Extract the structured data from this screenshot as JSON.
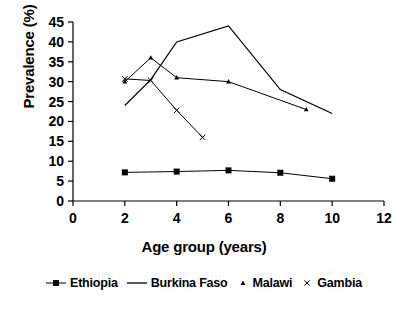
{
  "chart_data": {
    "type": "line",
    "title": "",
    "xlabel": "Age group (years)",
    "ylabel": "Prevalence (%)",
    "xlim": [
      0,
      12
    ],
    "ylim": [
      0,
      45
    ],
    "xticks": [
      0,
      2,
      4,
      6,
      8,
      10,
      12
    ],
    "yticks": [
      0,
      5,
      10,
      15,
      20,
      25,
      30,
      35,
      40,
      45
    ],
    "xtick_labels": [
      "0",
      "2",
      "4",
      "6",
      "8",
      "10",
      "12"
    ],
    "ytick_labels": [
      "0",
      "5",
      "10",
      "15",
      "20",
      "25",
      "30",
      "35",
      "40",
      "45"
    ],
    "grid": false,
    "legend_position": "bottom",
    "series": [
      {
        "name": "Ethiopia",
        "marker": "square",
        "color": "#000000",
        "x": [
          2,
          4,
          6,
          8,
          10
        ],
        "values": [
          7.2,
          7.4,
          7.7,
          7.1,
          5.6
        ]
      },
      {
        "name": "Burkina Faso",
        "marker": "none",
        "color": "#000000",
        "x": [
          2,
          3,
          4,
          6,
          8,
          10
        ],
        "values": [
          24,
          30.5,
          40,
          44,
          28,
          22
        ]
      },
      {
        "name": "Malawi",
        "marker": "triangle",
        "color": "#000000",
        "x": [
          2,
          3,
          4,
          6,
          9
        ],
        "values": [
          30,
          36,
          31,
          30,
          23
        ]
      },
      {
        "name": "Gambia",
        "marker": "cross",
        "color": "#000000",
        "x": [
          2,
          3,
          4,
          5
        ],
        "values": [
          30.7,
          30.3,
          22.8,
          16
        ]
      }
    ]
  },
  "legend": {
    "items": [
      {
        "label": "Ethiopia",
        "key": "square-line-marker"
      },
      {
        "label": "Burkina Faso",
        "key": "plain-line-marker"
      },
      {
        "label": "Malawi",
        "key": "triangle-marker"
      },
      {
        "label": "Gambia",
        "key": "cross-marker"
      }
    ]
  },
  "axes": {
    "y_title": "Prevalence (%)",
    "x_title": "Age group (years)"
  }
}
